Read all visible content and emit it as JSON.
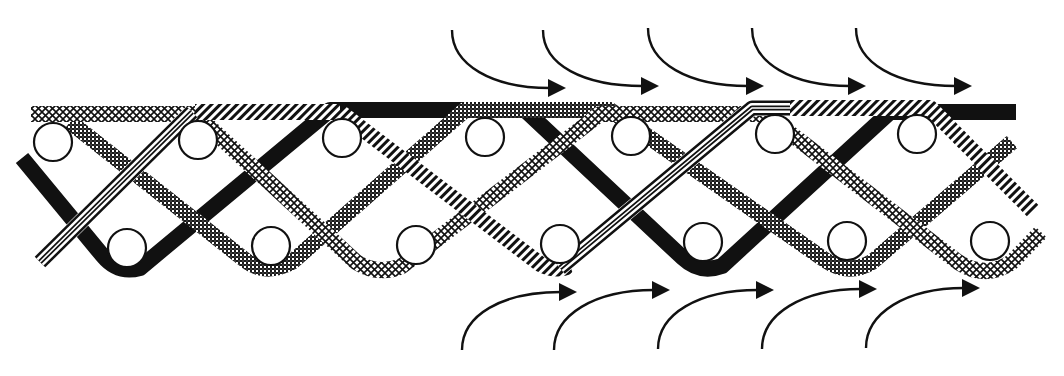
{
  "diagram": {
    "description": "Braided strands weaving over and under two rows of rods, with flow arrows above and below",
    "colors": {
      "background": "#ffffff",
      "ink": "#111111",
      "dark_hatch": "#222222"
    },
    "rods": {
      "radius": 19,
      "top_row": [
        {
          "x": 53,
          "y": 142
        },
        {
          "x": 198,
          "y": 140
        },
        {
          "x": 342,
          "y": 138
        },
        {
          "x": 485,
          "y": 137
        },
        {
          "x": 631,
          "y": 136
        },
        {
          "x": 775,
          "y": 134
        },
        {
          "x": 917,
          "y": 134
        }
      ],
      "bottom_row": [
        {
          "x": 127,
          "y": 248
        },
        {
          "x": 271,
          "y": 246
        },
        {
          "x": 416,
          "y": 245
        },
        {
          "x": 560,
          "y": 244
        },
        {
          "x": 703,
          "y": 242
        },
        {
          "x": 847,
          "y": 241
        },
        {
          "x": 990,
          "y": 241
        }
      ]
    },
    "strands": [
      {
        "name": "solid-black-strand",
        "fill": "solid",
        "path": "M22,158 L103,256 Q118,274 140,268 L330,110 L525,110 L683,258 Q700,274 722,266 L890,112 L1016,112"
      },
      {
        "name": "dark-crosshatch-strand",
        "fill": "dark-crosshatch",
        "path": "M70,122 L245,260 Q265,276 292,262 L465,110 L610,110 L825,260 Q848,276 872,262 L1012,142"
      },
      {
        "name": "light-crosshatch-strand",
        "fill": "light-crosshatch",
        "path": "M31,114 L195,114 L356,262 Q378,276 402,266 L600,114 L765,114 L958,262 Q985,280 1012,262 L1041,232"
      },
      {
        "name": "striped-strand",
        "fill": "stripes",
        "path": "M340,112 L540,264 Q555,272 570,266"
      },
      {
        "name": "striped-strand-top",
        "fill": "stripes",
        "path": "M195,112 L340,112"
      },
      {
        "name": "striped-strand-right",
        "fill": "stripes",
        "path": "M790,108 L930,108 L1034,212"
      },
      {
        "name": "double-line-strand-left",
        "fill": "double-line",
        "path": "M40,262 L192,112"
      },
      {
        "name": "double-line-strand-mid",
        "fill": "double-line",
        "path": "M560,268 L752,108 L790,108"
      }
    ],
    "arrows": {
      "top": [
        {
          "start": [
            452,
            30
          ],
          "tip": [
            566,
            88
          ]
        },
        {
          "start": [
            543,
            30
          ],
          "tip": [
            659,
            86
          ]
        },
        {
          "start": [
            648,
            28
          ],
          "tip": [
            764,
            86
          ]
        },
        {
          "start": [
            752,
            28
          ],
          "tip": [
            866,
            86
          ]
        },
        {
          "start": [
            856,
            28
          ],
          "tip": [
            972,
            86
          ]
        }
      ],
      "bottom": [
        {
          "start": [
            462,
            350
          ],
          "tip": [
            577,
            292
          ]
        },
        {
          "start": [
            554,
            350
          ],
          "tip": [
            670,
            290
          ]
        },
        {
          "start": [
            658,
            349
          ],
          "tip": [
            774,
            290
          ]
        },
        {
          "start": [
            762,
            349
          ],
          "tip": [
            877,
            289
          ]
        },
        {
          "start": [
            866,
            348
          ],
          "tip": [
            980,
            288
          ]
        }
      ]
    }
  }
}
